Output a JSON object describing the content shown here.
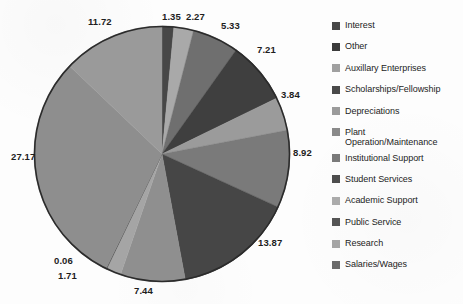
{
  "chart_data": {
    "type": "pie",
    "title": "",
    "subtitle": "",
    "xlabel": "",
    "ylabel": "",
    "legend_position": "right",
    "grid": false,
    "total": 100.69,
    "start_angle_deg": 0,
    "direction": "clockwise",
    "categories": [
      "Interest",
      "Other",
      "Auxillary Enterprises",
      "Scholarships/Fellowship",
      "Depreciations",
      "Plant Operation/Maintenance",
      "Institutional Support",
      "Student Services",
      "Academic Support",
      "Public Service",
      "Research",
      "Salaries/Wages"
    ],
    "values": [
      1.35,
      2.27,
      5.33,
      7.21,
      3.84,
      8.92,
      13.87,
      7.44,
      1.71,
      0.06,
      27.17,
      11.72
    ],
    "data_labels": [
      "1.35",
      "2.27",
      "5.33",
      "7.21",
      "3.84",
      "8.92",
      "13.87",
      "7.44",
      "1.71",
      "0.06",
      "27.17",
      "11.72"
    ],
    "colors": [
      "#474747",
      "#a9a9a9",
      "#6f6f6f",
      "#3f3f3f",
      "#9b9b9b",
      "#7a7a7a",
      "#464646",
      "#8f8f8f",
      "#a5a5a5",
      "#3b3b3b",
      "#8e8e8e",
      "#9a9a9a"
    ],
    "outline_color": "#2b2b2b"
  },
  "legend": {
    "items": [
      {
        "label": "Interest",
        "color": "#474747"
      },
      {
        "label": "Other",
        "color": "#3b3b3b"
      },
      {
        "label": "Auxillary Enterprises",
        "color": "#a0a0a0"
      },
      {
        "label": "Scholarships/Fellowship",
        "color": "#4a4a4a"
      },
      {
        "label": "Depreciations",
        "color": "#9b9b9b"
      },
      {
        "label": "Plant",
        "label2": "Operation/Maintenance",
        "color": "#8a8a8a"
      },
      {
        "label": "Institutional Support",
        "color": "#7a7a7a"
      },
      {
        "label": "Student Services",
        "color": "#4d4d4d"
      },
      {
        "label": "Academic Support",
        "color": "#ababab"
      },
      {
        "label": "Public Service",
        "color": "#555555"
      },
      {
        "label": "Research",
        "color": "#a5a5a5"
      },
      {
        "label": "Salaries/Wages",
        "color": "#6b6b6b"
      }
    ]
  },
  "labels": {
    "l0": "1.35",
    "l1": "2.27",
    "l2": "5.33",
    "l3": "7.21",
    "l4": "3.84",
    "l5": "8.92",
    "l6": "13.87",
    "l7": "7.44",
    "l8": "1.71",
    "l9": "0.06",
    "l10": "27.17",
    "l11": "11.72"
  }
}
